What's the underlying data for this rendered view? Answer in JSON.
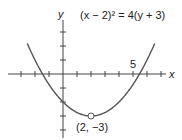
{
  "chart_data": {
    "type": "line",
    "title": "(x − 2)² = 4(y + 3)",
    "xlabel": "x",
    "ylabel": "y",
    "xlim": [
      -4,
      7
    ],
    "ylim": [
      -4,
      4
    ],
    "tick_spacing": 1,
    "tick_labels": [
      {
        "axis": "x",
        "value": 5,
        "label": "5"
      }
    ],
    "series": [
      {
        "name": "parabola",
        "equation": "(x-2)^2 = 4(y+3)",
        "x": [
          -2,
          -1,
          0,
          1,
          2,
          3,
          4,
          5,
          6
        ],
        "y": [
          1,
          -0.75,
          -2,
          -2.75,
          -3,
          -2.75,
          -2,
          -0.75,
          1
        ]
      }
    ],
    "annotations": [
      {
        "x": 2,
        "y": -3,
        "label": "(2, −3)",
        "marker": "open-circle"
      }
    ],
    "grid": false
  },
  "labels": {
    "equation": "(x − 2)² = 4(y + 3)",
    "x_axis": "x",
    "y_axis": "y",
    "tick_5": "5",
    "vertex": "(2, −3)"
  }
}
